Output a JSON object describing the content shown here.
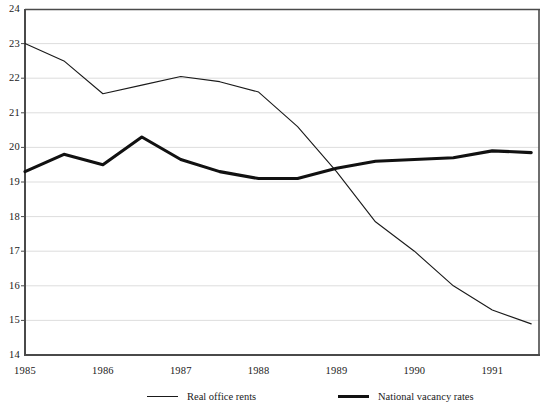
{
  "chart_data": {
    "type": "line",
    "title": "",
    "subtitle": "",
    "xlabel": "",
    "ylabel": "",
    "grid": true,
    "legend_position": "bottom",
    "xlim": [
      1985,
      1991.6
    ],
    "ylim": [
      14,
      24
    ],
    "ytick_step": 1,
    "yticks": [
      "24",
      "23",
      "22",
      "21",
      "20",
      "19",
      "18",
      "17",
      "16",
      "15",
      "14"
    ],
    "xticks": [
      "1985",
      "1986",
      "1987",
      "1988",
      "1989",
      "1990",
      "1991"
    ],
    "x": [
      1985.0,
      1985.5,
      1986.0,
      1986.5,
      1987.0,
      1987.5,
      1988.0,
      1988.5,
      1989.0,
      1989.5,
      1990.0,
      1990.5,
      1991.0,
      1991.5
    ],
    "series": [
      {
        "name": "Real office rents",
        "style": "thin",
        "color": "#1a1a1a",
        "width": 1.1,
        "values": [
          23.0,
          22.5,
          21.55,
          21.8,
          22.05,
          21.9,
          21.6,
          20.6,
          19.3,
          17.85,
          17.0,
          16.0,
          15.3,
          14.9
        ]
      },
      {
        "name": "National vacancy rates",
        "style": "thick",
        "color": "#111111",
        "width": 3.1,
        "values": [
          19.3,
          19.8,
          19.5,
          20.3,
          19.65,
          19.3,
          19.1,
          19.1,
          19.4,
          19.6,
          19.65,
          19.7,
          19.9,
          19.85
        ]
      }
    ]
  },
  "legend": {
    "items": [
      {
        "label": "Real office rents",
        "style": "thin"
      },
      {
        "label": "National vacancy rates",
        "style": "thick"
      }
    ]
  },
  "footnotes": {
    "left": "",
    "right": ""
  },
  "colors": {
    "axis": "#4a4a4a",
    "grid": "#d9d9d9",
    "text": "#1a1a1a",
    "background": "#ffffff"
  }
}
